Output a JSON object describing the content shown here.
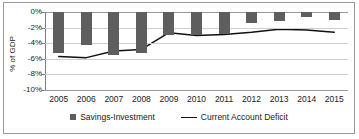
{
  "chart_data": {
    "type": "bar",
    "title": "",
    "xlabel": "",
    "ylabel": "% of GDP",
    "ylim": [
      -10,
      0
    ],
    "ytick_labels": [
      "0%",
      "-2%",
      "-4%",
      "-6%",
      "-8%",
      "-10%"
    ],
    "ytick_values": [
      0,
      -2,
      -4,
      -6,
      -8,
      -10
    ],
    "grid": true,
    "legend_position": "bottom",
    "categories": [
      "2005",
      "2006",
      "2007",
      "2008",
      "2009",
      "2010",
      "2011",
      "2012",
      "2013",
      "2014",
      "2015"
    ],
    "series": [
      {
        "name": "Savings-Investment",
        "type": "bar",
        "color": "#5e5e5e",
        "values": [
          -5.2,
          -4.2,
          -5.5,
          -5.2,
          -3.0,
          -3.0,
          -2.8,
          -1.4,
          -1.2,
          -0.7,
          -1.0
        ]
      },
      {
        "name": "Current Account Deficit",
        "type": "line",
        "color": "#111111",
        "values": [
          -5.7,
          -5.85,
          -5.0,
          -4.8,
          -2.65,
          -3.0,
          -2.9,
          -2.6,
          -2.2,
          -2.3,
          -2.6
        ]
      }
    ]
  },
  "legend": {
    "items": [
      {
        "label": "Savings-Investment",
        "marker": "square-marker"
      },
      {
        "label": "Current Account Deficit",
        "marker": "line-marker"
      }
    ]
  },
  "axis": {
    "y_title": "% of GDP"
  }
}
